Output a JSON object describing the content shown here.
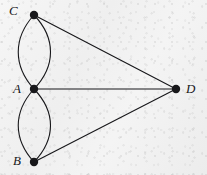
{
  "figure": {
    "kind": "graph-diagram",
    "background_color": "#f1f1f1",
    "ink_color": "#17171a",
    "edge_stroke_width": 1.1,
    "vertex_radius": 4.2
  },
  "vertices": [
    {
      "id": "C",
      "label": "C",
      "x": 34,
      "y": 15,
      "label_x": 9,
      "label_y": 4
    },
    {
      "id": "A",
      "label": "A",
      "x": 34,
      "y": 89,
      "label_x": 13,
      "label_y": 82
    },
    {
      "id": "B",
      "label": "B",
      "x": 34,
      "y": 162,
      "label_x": 13,
      "label_y": 154
    },
    {
      "id": "D",
      "label": "D",
      "x": 176,
      "y": 89,
      "label_x": 186,
      "label_y": 82
    }
  ],
  "edges": [
    {
      "id": "C-A-left",
      "from": "C",
      "to": "A",
      "shape": "curve",
      "bow": -21
    },
    {
      "id": "C-A-right",
      "from": "C",
      "to": "A",
      "shape": "curve",
      "bow": 21
    },
    {
      "id": "A-B-left",
      "from": "A",
      "to": "B",
      "shape": "curve",
      "bow": -21
    },
    {
      "id": "A-B-right",
      "from": "A",
      "to": "B",
      "shape": "curve",
      "bow": 21
    },
    {
      "id": "C-D",
      "from": "C",
      "to": "D",
      "shape": "line",
      "bow": 0
    },
    {
      "id": "A-D",
      "from": "A",
      "to": "D",
      "shape": "line",
      "bow": 0
    },
    {
      "id": "B-D",
      "from": "B",
      "to": "D",
      "shape": "line",
      "bow": 0
    }
  ]
}
